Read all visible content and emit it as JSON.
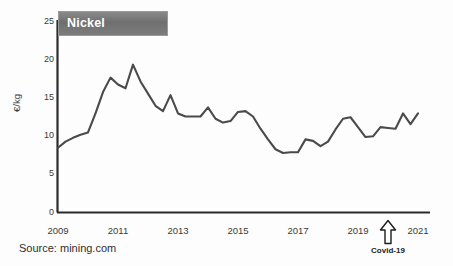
{
  "chart_data": {
    "type": "line",
    "title": "Nickel",
    "xlabel": "",
    "ylabel": "€/kg",
    "xlim": [
      2009,
      2021
    ],
    "ylim": [
      0,
      25
    ],
    "yticks": [
      0,
      5,
      10,
      15,
      20,
      25
    ],
    "xticks": [
      2009,
      2011,
      2013,
      2015,
      2017,
      2019,
      2021
    ],
    "grid": false,
    "legend": "none",
    "line_color": "#4a4a4a",
    "series": [
      {
        "name": "Nickel",
        "unit": "€/kg",
        "x": [
          2009.0,
          2009.25,
          2009.5,
          2009.75,
          2010.0,
          2010.25,
          2010.5,
          2010.75,
          2011.0,
          2011.25,
          2011.5,
          2011.75,
          2012.0,
          2012.25,
          2012.5,
          2012.75,
          2013.0,
          2013.25,
          2013.5,
          2013.75,
          2014.0,
          2014.25,
          2014.5,
          2014.75,
          2015.0,
          2015.25,
          2015.5,
          2015.75,
          2016.0,
          2016.25,
          2016.5,
          2016.75,
          2017.0,
          2017.25,
          2017.5,
          2017.75,
          2018.0,
          2018.25,
          2018.5,
          2018.75,
          2019.0,
          2019.25,
          2019.5,
          2019.75,
          2020.0,
          2020.25,
          2020.5,
          2020.75,
          2021.0
        ],
        "y": [
          8.5,
          9.3,
          9.8,
          10.2,
          10.5,
          13.0,
          15.8,
          17.7,
          16.8,
          16.3,
          19.4,
          17.2,
          15.6,
          14.0,
          13.3,
          15.4,
          13.0,
          12.6,
          12.6,
          12.6,
          13.8,
          12.3,
          11.8,
          12.0,
          13.2,
          13.3,
          12.6,
          11.0,
          9.6,
          8.3,
          7.8,
          7.9,
          7.9,
          9.6,
          9.4,
          8.7,
          9.3,
          10.9,
          12.3,
          12.5,
          11.2,
          9.9,
          10.0,
          11.2,
          11.1,
          11.0,
          13.0,
          11.6,
          13.0
        ]
      }
    ],
    "annotations": [
      {
        "name": "covid-19-marker",
        "label": "Covid-19",
        "icon": "up-arrow-icon",
        "x": 2020.0
      }
    ],
    "source": "Source: mining.com"
  },
  "chart": {
    "title_banner_label": "Nickel",
    "y_axis_title": "€/kg",
    "y_tick_labels": [
      "25",
      "20",
      "15",
      "10",
      "5",
      "0"
    ],
    "x_tick_labels": [
      "2009",
      "2011",
      "2013",
      "2015",
      "2017",
      "2019",
      "2021"
    ],
    "source_text": "Source: mining.com",
    "covid_label": "Covid-19",
    "colors": {
      "line": "#4a4a4a",
      "axis": "#2b2b2b",
      "banner_start": "#8a8a8a",
      "banner_end": "#7d7d7d",
      "banner_text": "#ffffff",
      "tick_text": "#3a3a3a",
      "background": "#fdfdfd"
    }
  }
}
